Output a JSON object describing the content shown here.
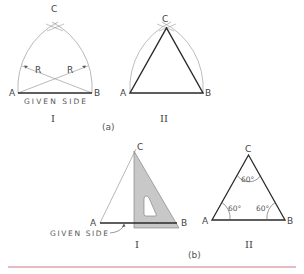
{
  "colors": {
    "top_rule_start": "#c06ad6",
    "top_rule_end": "#d48a7a",
    "bottom_rule": "#c97a86",
    "construction": "#9a9a9a",
    "heavy": "#2a2a2a",
    "set_square_fill": "#c8c8c8",
    "set_square_stroke": "#777777"
  },
  "part_a": {
    "caption": "(a)",
    "fig1": {
      "roman": "I",
      "vertex_a": "A",
      "vertex_b": "B",
      "vertex_c": "C",
      "radius_left": "R",
      "radius_right": "R",
      "given_side": "GIVEN SIDE"
    },
    "fig2": {
      "roman": "II",
      "vertex_a": "A",
      "vertex_b": "B",
      "vertex_c": "C"
    }
  },
  "part_b": {
    "caption": "(b)",
    "fig1": {
      "roman": "I",
      "vertex_a": "A",
      "vertex_b": "B",
      "vertex_c": "C",
      "given_side": "GIVEN SIDE"
    },
    "fig2": {
      "roman": "II",
      "vertex_a": "A",
      "vertex_b": "B",
      "vertex_c": "C",
      "angle_top": "60°",
      "angle_left": "60°",
      "angle_right": "60°"
    }
  }
}
